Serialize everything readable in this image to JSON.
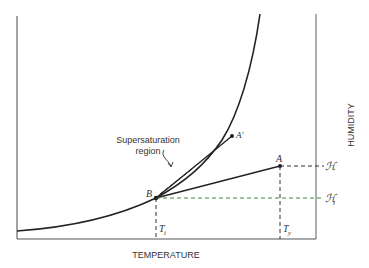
{
  "diagram": {
    "title": "",
    "x_axis_label": "TEMPERATURE",
    "y_axis_label": "HUMIDITY",
    "annotation": {
      "line1": "Supersaturation",
      "line2": "region"
    },
    "points": {
      "A": "A",
      "A_prime": "A'",
      "B": "B"
    },
    "x_markers": {
      "Ti": "T",
      "Ti_sub": "i",
      "Ty": "T",
      "Ty_sub": "y"
    },
    "y_markers": {
      "H": "ℋ",
      "Hi": "ℋ",
      "Hi_sub": "i"
    },
    "colors": {
      "axis": "#777777",
      "curve": "#222222",
      "dashed": "#333333",
      "dashed_accent": "#3a8a3a"
    }
  }
}
